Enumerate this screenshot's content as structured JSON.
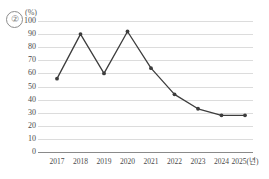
{
  "figure": {
    "item_number": "②",
    "unit_label": "(%)"
  },
  "chart_data": {
    "type": "line",
    "title": "",
    "xlabel": "",
    "ylabel": "(%)",
    "categories": [
      "2017",
      "2018",
      "2019",
      "2020",
      "2021",
      "2022",
      "2023",
      "2024",
      "2025(년)"
    ],
    "values": [
      56,
      90,
      60,
      92,
      64,
      44,
      33,
      28,
      28
    ],
    "ylim": [
      0,
      100
    ],
    "ytick_labels": [
      "100",
      "90",
      "80",
      "70",
      "60",
      "50",
      "40",
      "30",
      "20",
      "10",
      "0"
    ],
    "ytick_values": [
      100,
      90,
      80,
      70,
      60,
      50,
      40,
      30,
      20,
      10,
      0
    ],
    "grid": true,
    "legend": "none",
    "series_color": "#3d3d3d",
    "grid_color": "#dcdcdc",
    "axis_color": "#8a8a8a",
    "marker": "dot"
  }
}
